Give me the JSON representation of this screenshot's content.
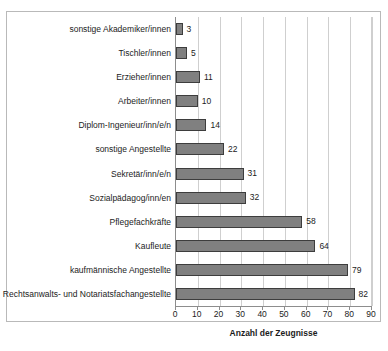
{
  "clipped_header": "",
  "chart_data": {
    "type": "bar",
    "orientation": "horizontal",
    "title": "",
    "xlabel": "Anzahl der Zeugnisse",
    "ylabel": "",
    "xlim": [
      0,
      90
    ],
    "xticks": [
      0,
      10,
      20,
      30,
      40,
      50,
      60,
      70,
      80,
      90
    ],
    "xtick_labels": [
      "0",
      "10",
      "20",
      "30",
      "40",
      "50",
      "60",
      "70",
      "80",
      "90"
    ],
    "grid": "vertical",
    "legend": null,
    "bar_color": "#808080",
    "bar_edge_color": "#3d3d3d",
    "categories": [
      "sonstige Akademiker/innen",
      "Tischler/innen",
      "Erzieher/innen",
      "Arbeiter/innen",
      "Diplom-Ingenieur/inn/e/n",
      "sonstige Angestellte",
      "Sekretär/inn/e/n",
      "Sozialpädagog/inn/en",
      "Pflegefachkräfte",
      "Kaufleute",
      "kaufmännische Angestellte",
      "Rechtsanwalts- und Notariatsfachangestellte"
    ],
    "values": [
      3,
      5,
      11,
      10,
      14,
      22,
      31,
      32,
      58,
      64,
      79,
      82
    ],
    "data_labels": [
      "3",
      "5",
      "11",
      "10",
      "14",
      "22",
      "31",
      "32",
      "58",
      "64",
      "79",
      "82"
    ]
  }
}
